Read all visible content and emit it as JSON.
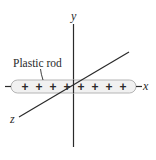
{
  "diagram": {
    "axes": {
      "x_label": "x",
      "y_label": "y",
      "z_label": "z"
    },
    "rod": {
      "label": "Plastic rod",
      "charge_symbol": "+",
      "charge_count": 8,
      "fill_color": "#f1f1f1",
      "stroke_color": "#b5b5b5"
    },
    "line_color": "#2a2a2a"
  }
}
